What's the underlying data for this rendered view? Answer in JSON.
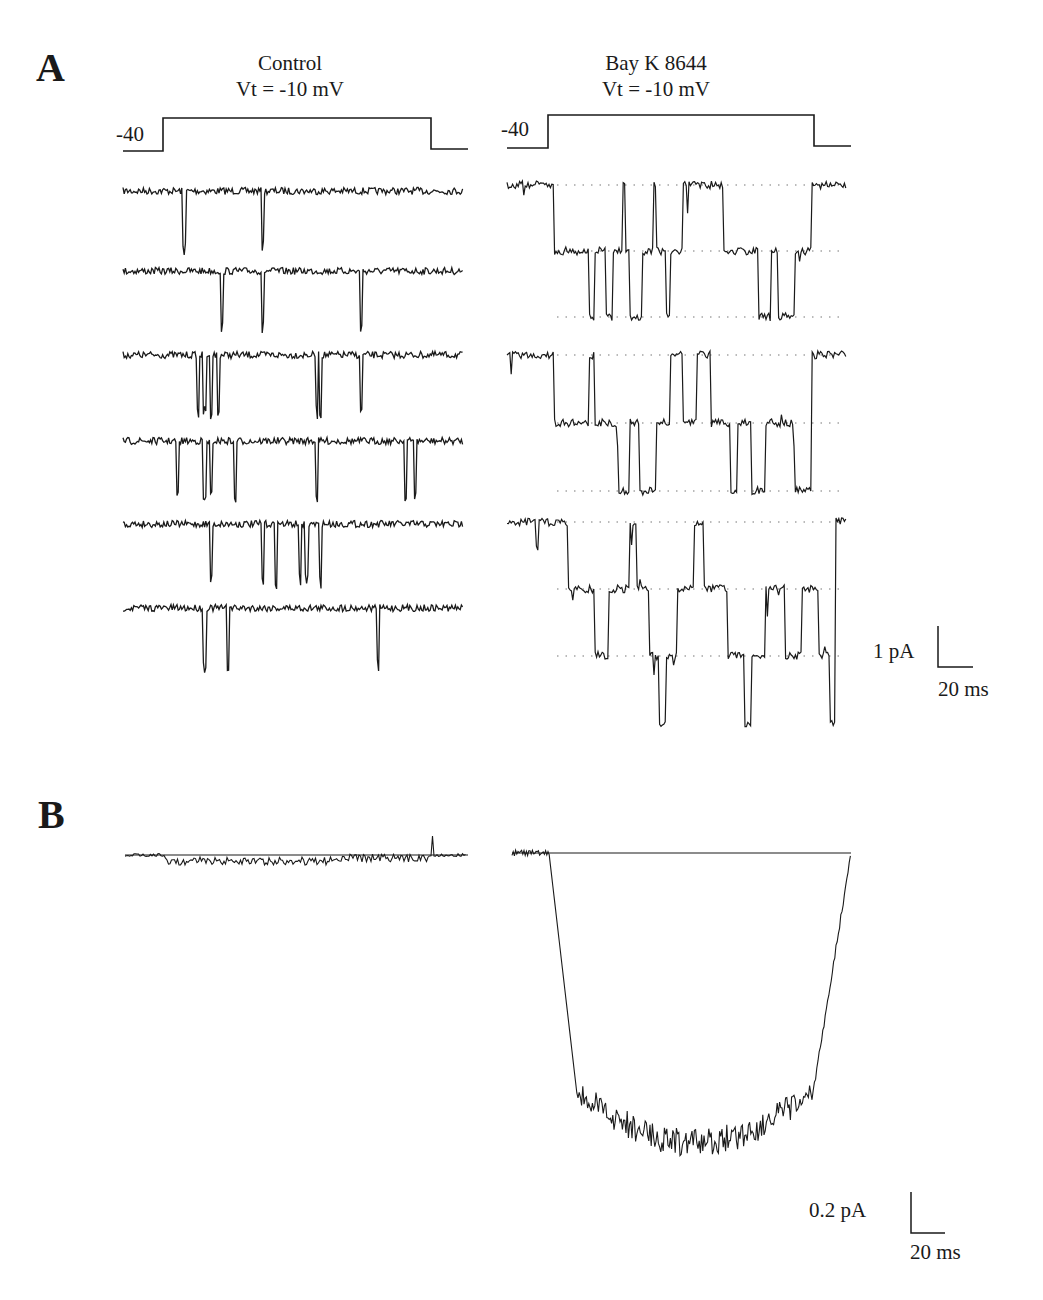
{
  "figure": {
    "panel_a_label": "A",
    "panel_b_label": "B",
    "conditions": [
      {
        "title": "Control",
        "voltage": "Vt = -10 mV",
        "holding_label": "-40"
      },
      {
        "title": "Bay K 8644",
        "voltage": "Vt = -10 mV",
        "holding_label": "-40"
      }
    ],
    "scale_bar_a": {
      "current": "1 pA",
      "time": "20 ms"
    },
    "scale_bar_b": {
      "current": "0.2 pA",
      "time": "20 ms"
    },
    "colors": {
      "trace": "#1a1a1a",
      "dotted_levels": "#777777",
      "background": "#ffffff"
    }
  },
  "chart_data": [
    {
      "type": "line",
      "title": "A — Control, Vt = -10 mV (single-channel sweeps)",
      "xlabel": "time (scale bar 20 ms)",
      "ylabel": "current (scale bar 1 pA)",
      "voltage_protocol": {
        "holding_mV": -40,
        "test_mV": -10
      },
      "sweeps": 6,
      "description": "Brief, sparse downward openings (flickers) from closed baseline",
      "openings_x_fraction": [
        [
          0.18,
          0.41
        ],
        [
          0.29,
          0.41,
          0.7
        ],
        [
          0.22,
          0.24,
          0.26,
          0.28,
          0.57,
          0.58,
          0.7
        ],
        [
          0.16,
          0.24,
          0.26,
          0.33,
          0.57,
          0.83,
          0.86
        ],
        [
          0.26,
          0.41,
          0.45,
          0.52,
          0.54,
          0.58
        ],
        [
          0.24,
          0.31,
          0.75
        ]
      ]
    },
    {
      "type": "line",
      "title": "A — Bay K 8644, Vt = -10 mV (single-channel sweeps)",
      "xlabel": "time (scale bar 20 ms)",
      "ylabel": "current (scale bar 1 pA)",
      "voltage_protocol": {
        "holding_mV": -40,
        "test_mV": -10
      },
      "sweeps": 3,
      "levels_pA": [
        0,
        -1,
        -2
      ],
      "description": "Long openings with up to 2–3 simultaneously open channels; dotted lines mark unitary levels"
    },
    {
      "type": "line",
      "title": "B — Ensemble average currents",
      "xlabel": "time (scale bar 20 ms)",
      "ylabel": "current (scale bar 0.2 pA)",
      "series": [
        {
          "name": "Control",
          "peak_pA": -0.02,
          "shape": "small noisy inward current near baseline"
        },
        {
          "name": "Bay K 8644",
          "peak_pA": -0.8,
          "shape": "large sustained inward current, rapid activation, rapid tail at repolarization"
        }
      ]
    }
  ]
}
